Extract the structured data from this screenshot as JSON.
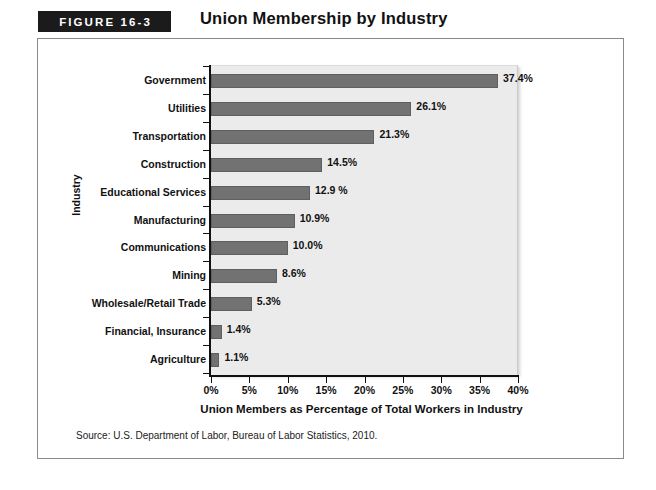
{
  "figure": {
    "badge_label": "FIGURE 16-3",
    "title": "Union Membership by Industry",
    "source_note": "Source: U.S. Department of Labor, Bureau of Labor Statistics, 2010.",
    "bar_color": "#727272",
    "plot_background": "#ebebeb",
    "badge_background": "#1b1b1b"
  },
  "chart_data": {
    "type": "bar",
    "orientation": "horizontal",
    "title": "Union Membership by Industry",
    "xlabel": "Union Members as Percentage of Total Workers in Industry",
    "ylabel": "Industry",
    "xlim": [
      0,
      40
    ],
    "grid": false,
    "legend": "none",
    "xtick_labels": [
      "0%",
      "5%",
      "10%",
      "15%",
      "20%",
      "25%",
      "30%",
      "35%",
      "40%"
    ],
    "xticks": [
      0,
      5,
      10,
      15,
      20,
      25,
      30,
      35,
      40
    ],
    "categories": [
      "Government",
      "Utilities",
      "Transportation",
      "Construction",
      "Educational Services",
      "Manufacturing",
      "Communications",
      "Mining",
      "Wholesale/Retail Trade",
      "Financial, Insurance",
      "Agriculture"
    ],
    "values": [
      37.4,
      26.1,
      21.3,
      14.5,
      12.9,
      10.9,
      10.0,
      8.6,
      5.3,
      1.4,
      1.1
    ],
    "data_labels": [
      "37.4%",
      "26.1%",
      "21.3%",
      "14.5%",
      "12.9 %",
      "10.9%",
      "10.0%",
      "8.6%",
      "5.3%",
      "1.4%",
      "1.1%"
    ]
  }
}
